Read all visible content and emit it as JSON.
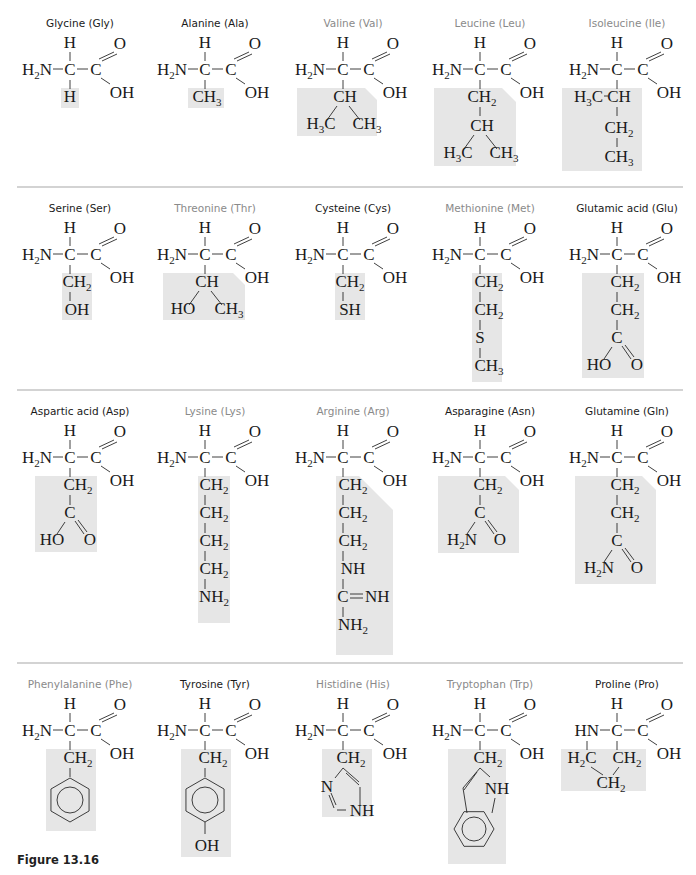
{
  "figure": {
    "caption": "Figure 13.16",
    "colors": {
      "title_dark": "#1a1a1a",
      "title_light": "#8a8a8a",
      "shade": "#e6e6e6",
      "divider": "#a8a8a8"
    },
    "dividers_y": [
      187,
      390,
      663
    ],
    "backbone": {
      "alpha_h": "H",
      "amine": "H2N",
      "alpha_c": "C",
      "carboxyl_c": "C",
      "carbonyl_o": "O",
      "hydroxyl": "OH"
    },
    "rows": [
      {
        "cells": [
          {
            "name": "Glycine",
            "abbr": "Gly",
            "label": "Glycine (Gly)",
            "title_style": "dark",
            "side_chain": [
              "H"
            ]
          },
          {
            "name": "Alanine",
            "abbr": "Ala",
            "label": "Alanine (Ala)",
            "title_style": "dark",
            "side_chain": [
              "CH3"
            ]
          },
          {
            "name": "Valine",
            "abbr": "Val",
            "label": "Valine (Val)",
            "title_style": "light",
            "side_chain": [
              "CH",
              "H3C",
              "CH3"
            ]
          },
          {
            "name": "Leucine",
            "abbr": "Leu",
            "label": "Leucine (Leu)",
            "title_style": "light",
            "side_chain": [
              "CH2",
              "CH",
              "H3C",
              "CH3"
            ]
          },
          {
            "name": "Isoleucine",
            "abbr": "Ile",
            "label": "Isoleucine (Ile)",
            "title_style": "light",
            "side_chain": [
              "H3C",
              "CH",
              "CH2",
              "CH3"
            ]
          }
        ]
      },
      {
        "cells": [
          {
            "name": "Serine",
            "abbr": "Ser",
            "label": "Serine (Ser)",
            "title_style": "dark",
            "side_chain": [
              "CH2",
              "OH"
            ]
          },
          {
            "name": "Threonine",
            "abbr": "Thr",
            "label": "Threonine (Thr)",
            "title_style": "light",
            "side_chain": [
              "CH",
              "HO",
              "CH3"
            ]
          },
          {
            "name": "Cysteine",
            "abbr": "Cys",
            "label": "Cysteine (Cys)",
            "title_style": "dark",
            "side_chain": [
              "CH2",
              "SH"
            ]
          },
          {
            "name": "Methionine",
            "abbr": "Met",
            "label": "Methionine (Met)",
            "title_style": "light",
            "side_chain": [
              "CH2",
              "CH2",
              "S",
              "CH3"
            ]
          },
          {
            "name": "Glutamic acid",
            "abbr": "Glu",
            "label": "Glutamic acid (Glu)",
            "title_style": "dark",
            "side_chain": [
              "CH2",
              "CH2",
              "C",
              "HO",
              "O"
            ]
          }
        ]
      },
      {
        "cells": [
          {
            "name": "Aspartic acid",
            "abbr": "Asp",
            "label": "Aspartic acid (Asp)",
            "title_style": "dark",
            "side_chain": [
              "CH2",
              "C",
              "HO",
              "O"
            ]
          },
          {
            "name": "Lysine",
            "abbr": "Lys",
            "label": "Lysine (Lys)",
            "title_style": "light",
            "side_chain": [
              "CH2",
              "CH2",
              "CH2",
              "CH2",
              "NH2"
            ]
          },
          {
            "name": "Arginine",
            "abbr": "Arg",
            "label": "Arginine (Arg)",
            "title_style": "light",
            "side_chain": [
              "CH2",
              "CH2",
              "CH2",
              "NH",
              "C",
              "NH",
              "NH2"
            ]
          },
          {
            "name": "Asparagine",
            "abbr": "Asn",
            "label": "Asparagine (Asn)",
            "title_style": "dark",
            "side_chain": [
              "CH2",
              "C",
              "H2N",
              "O"
            ]
          },
          {
            "name": "Glutamine",
            "abbr": "Gln",
            "label": "Glutamine (Gln)",
            "title_style": "dark",
            "side_chain": [
              "CH2",
              "CH2",
              "C",
              "H2N",
              "O"
            ]
          }
        ]
      },
      {
        "cells": [
          {
            "name": "Phenylalanine",
            "abbr": "Phe",
            "label": "Phenylalanine (Phe)",
            "title_style": "light",
            "side_chain": [
              "CH2",
              "benzene-ring"
            ]
          },
          {
            "name": "Tyrosine",
            "abbr": "Tyr",
            "label": "Tyrosine (Tyr)",
            "title_style": "dark",
            "side_chain": [
              "CH2",
              "benzene-ring",
              "OH"
            ]
          },
          {
            "name": "Histidine",
            "abbr": "His",
            "label": "Histidine (His)",
            "title_style": "light",
            "side_chain": [
              "CH2",
              "imidazole-ring",
              "N",
              "NH"
            ]
          },
          {
            "name": "Tryptophan",
            "abbr": "Trp",
            "label": "Tryptophan (Trp)",
            "title_style": "light",
            "side_chain": [
              "CH2",
              "indole-ring",
              "NH"
            ]
          },
          {
            "name": "Proline",
            "abbr": "Pro",
            "label": "Proline (Pro)",
            "title_style": "dark",
            "amine_override": "HN",
            "side_chain": [
              "H2C",
              "CH2",
              "CH2"
            ]
          }
        ]
      }
    ]
  }
}
